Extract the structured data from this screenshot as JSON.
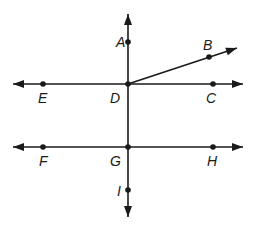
{
  "diagram": {
    "type": "geometry-lines",
    "colors": {
      "ink": "#1a1a1a",
      "background": "#ffffff"
    },
    "points": [
      {
        "id": "A",
        "label": "A",
        "x": 128,
        "y": 42,
        "lx": 116,
        "ly": 47
      },
      {
        "id": "B",
        "label": "B",
        "x": 209,
        "y": 57,
        "lx": 203,
        "ly": 50
      },
      {
        "id": "C",
        "label": "C",
        "x": 213,
        "y": 84,
        "lx": 206,
        "ly": 103
      },
      {
        "id": "D",
        "label": "D",
        "x": 128,
        "y": 84,
        "lx": 110,
        "ly": 103
      },
      {
        "id": "E",
        "label": "E",
        "x": 43,
        "y": 84,
        "lx": 38,
        "ly": 103
      },
      {
        "id": "F",
        "label": "F",
        "x": 43,
        "y": 147,
        "lx": 39,
        "ly": 166
      },
      {
        "id": "G",
        "label": "G",
        "x": 128,
        "y": 147,
        "lx": 110,
        "ly": 166
      },
      {
        "id": "H",
        "label": "H",
        "x": 213,
        "y": 147,
        "lx": 207,
        "ly": 166
      },
      {
        "id": "I",
        "label": "I",
        "x": 128,
        "y": 190,
        "lx": 117,
        "ly": 196
      }
    ],
    "lines": [
      {
        "name": "line-ED-C",
        "desc": "horizontal line through E, D, C",
        "x1": 13,
        "y1": 84,
        "x2": 243,
        "y2": 84,
        "arrows": "both"
      },
      {
        "name": "line-FG-H",
        "desc": "horizontal line through F, G, H",
        "x1": 13,
        "y1": 147,
        "x2": 243,
        "y2": 147,
        "arrows": "both"
      },
      {
        "name": "line-A-D-G-I",
        "desc": "vertical line through A, D, G, I",
        "x1": 128,
        "y1": 14,
        "x2": 128,
        "y2": 217,
        "arrows": "both"
      },
      {
        "name": "ray-DB",
        "desc": "ray from D through B",
        "x1": 128,
        "y1": 84,
        "x2": 237,
        "y2": 48,
        "arrows": "end"
      }
    ]
  }
}
